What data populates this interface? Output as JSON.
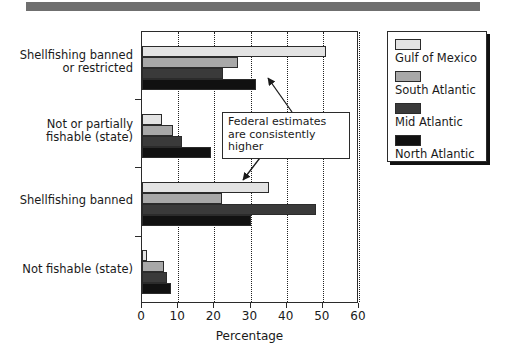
{
  "banner": {
    "name": "top-banner-strip",
    "color": "#6f6f6f"
  },
  "chart_data": {
    "type": "bar",
    "orientation": "horizontal",
    "title": "",
    "xlabel": "Percentage",
    "ylabel": "",
    "xlim": [
      0,
      60
    ],
    "xticks": [
      0,
      10,
      20,
      30,
      40,
      50,
      60
    ],
    "grid": "vertical-dotted",
    "legend_position": "right-outside",
    "categories": [
      "Shellfishing banned or restricted",
      "Not or partially fishable (state)",
      "Shellfishing banned",
      "Not fishable (state)"
    ],
    "category_lines": [
      [
        "Shellfishing banned",
        "or restricted"
      ],
      [
        "Not or partially",
        "fishable (state)"
      ],
      [
        "Shellfishing banned"
      ],
      [
        "Not fishable (state)"
      ]
    ],
    "series": [
      {
        "name": "Gulf of Mexico",
        "color": "#e3e3e3",
        "values": [
          51.0,
          5.5,
          35.0,
          1.4
        ]
      },
      {
        "name": "South Atlantic",
        "color": "#a8a8a8",
        "values": [
          26.5,
          8.5,
          22.0,
          6.0
        ]
      },
      {
        "name": "Mid Atlantic",
        "color": "#3a3a3a",
        "values": [
          22.5,
          11.0,
          48.0,
          7.0
        ]
      },
      {
        "name": "North Atlantic",
        "color": "#111111",
        "values": [
          31.5,
          19.0,
          30.0,
          8.0
        ]
      }
    ],
    "annotations": [
      {
        "text": "Federal estimates are consistently higher",
        "lines": [
          "Federal estimates",
          "are consistently higher"
        ],
        "points_to": [
          "Shellfishing banned or restricted",
          "Shellfishing banned"
        ]
      }
    ]
  },
  "axis": {
    "x_title": "Percentage",
    "x_tick_labels": [
      "0",
      "10",
      "20",
      "30",
      "40",
      "50",
      "60"
    ]
  },
  "legend": {
    "items": [
      {
        "label": "Gulf of Mexico",
        "swatch": "swatch-gulf-of-mexico"
      },
      {
        "label": "South Atlantic",
        "swatch": "swatch-south-atlantic"
      },
      {
        "label": "Mid Atlantic",
        "swatch": "swatch-mid-atlantic"
      },
      {
        "label": "North Atlantic",
        "swatch": "swatch-north-atlantic"
      }
    ]
  },
  "annotation": {
    "line1": "Federal estimates",
    "line2": "are consistently higher"
  }
}
